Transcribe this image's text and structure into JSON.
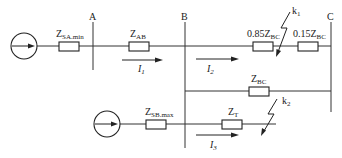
{
  "diagram": {
    "type": "power-system-single-line",
    "buses": [
      {
        "id": "A",
        "label": "A"
      },
      {
        "id": "B",
        "label": "B"
      },
      {
        "id": "C",
        "label": "C"
      }
    ],
    "sources": [
      {
        "id": "SA",
        "impedance": {
          "main": "Z",
          "sub": "SA.min"
        }
      },
      {
        "id": "SB",
        "impedance": {
          "main": "Z",
          "sub": "SB.max"
        }
      }
    ],
    "impedances": {
      "zab": {
        "main": "Z",
        "sub": "AB"
      },
      "zbc_085": {
        "coef": "0.85",
        "main": "Z",
        "sub": "BC"
      },
      "zbc_015": {
        "coef": "0.15",
        "main": "Z",
        "sub": "BC"
      },
      "zbc_parallel": {
        "main": "Z",
        "sub": "BC"
      },
      "zt": {
        "main": "Z",
        "sub": "T"
      }
    },
    "faults": [
      {
        "id": "k1",
        "main": "k",
        "sub": "1"
      },
      {
        "id": "k2",
        "main": "k",
        "sub": "2"
      }
    ],
    "currents": [
      {
        "id": "I1",
        "main": "I",
        "sub": "1"
      },
      {
        "id": "I2",
        "main": "I",
        "sub": "2"
      },
      {
        "id": "I3",
        "main": "I",
        "sub": "3"
      }
    ]
  }
}
